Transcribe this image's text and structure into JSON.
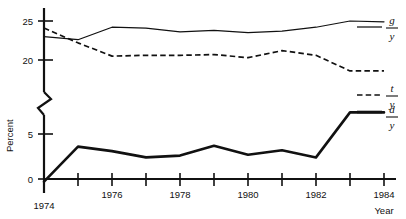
{
  "chart_data": {
    "type": "line",
    "title": "",
    "xlabel": "Year",
    "ylabel": "Percent",
    "grid": false,
    "legend_position": "right",
    "axis_break": true,
    "axis_break_note": "y-axis broken between 5 and 20",
    "x": [
      1974,
      1975,
      1976,
      1977,
      1978,
      1979,
      1980,
      1981,
      1982,
      1983,
      1984
    ],
    "xlim": [
      1974,
      1984
    ],
    "xticks": [
      1974,
      1975,
      1976,
      1977,
      1978,
      1979,
      1980,
      1981,
      1982,
      1983,
      1984
    ],
    "xticklabels": [
      "1974",
      "",
      "1976",
      "",
      "1978",
      "",
      "1980",
      "",
      "1982",
      "",
      "1984"
    ],
    "yticks_upper": [
      20,
      25
    ],
    "yticks_lower": [
      0,
      5
    ],
    "yticklabels": [
      "0",
      "5",
      "20",
      "25"
    ],
    "series": [
      {
        "name": "g/y",
        "numerator": "g",
        "denominator": "y",
        "style": "solid-thin",
        "values": [
          23.0,
          22.6,
          24.2,
          24.1,
          23.6,
          23.8,
          23.5,
          23.7,
          24.2,
          25.0,
          24.9
        ]
      },
      {
        "name": "t/y",
        "numerator": "t",
        "denominator": "y",
        "style": "dashed",
        "values": [
          24.1,
          22.2,
          20.5,
          20.6,
          20.6,
          20.7,
          20.3,
          21.2,
          20.6,
          18.6,
          18.6
        ]
      },
      {
        "name": "d/y",
        "numerator": "d",
        "denominator": "y",
        "style": "solid-thick",
        "values": [
          -0.3,
          3.6,
          3.1,
          2.4,
          2.6,
          3.7,
          2.7,
          3.2,
          2.4,
          7.4,
          7.4
        ]
      }
    ]
  },
  "legend": [
    {
      "id": "gy",
      "numerator": "g",
      "denominator": "y"
    },
    {
      "id": "ty",
      "numerator": "t",
      "denominator": "y"
    },
    {
      "id": "dy",
      "numerator": "d",
      "denominator": "y"
    }
  ],
  "axes": {
    "ylabel": "Percent",
    "xlabel": "Year",
    "ytick_25": "25",
    "ytick_20": "20",
    "ytick_5": "5",
    "ytick_0": "0",
    "xtick_1974": "1974",
    "xtick_1976": "1976",
    "xtick_1978": "1978",
    "xtick_1980": "1980",
    "xtick_1982": "1982",
    "xtick_1984": "1984"
  },
  "colors": {
    "ink": "#111111",
    "background": "#ffffff"
  }
}
